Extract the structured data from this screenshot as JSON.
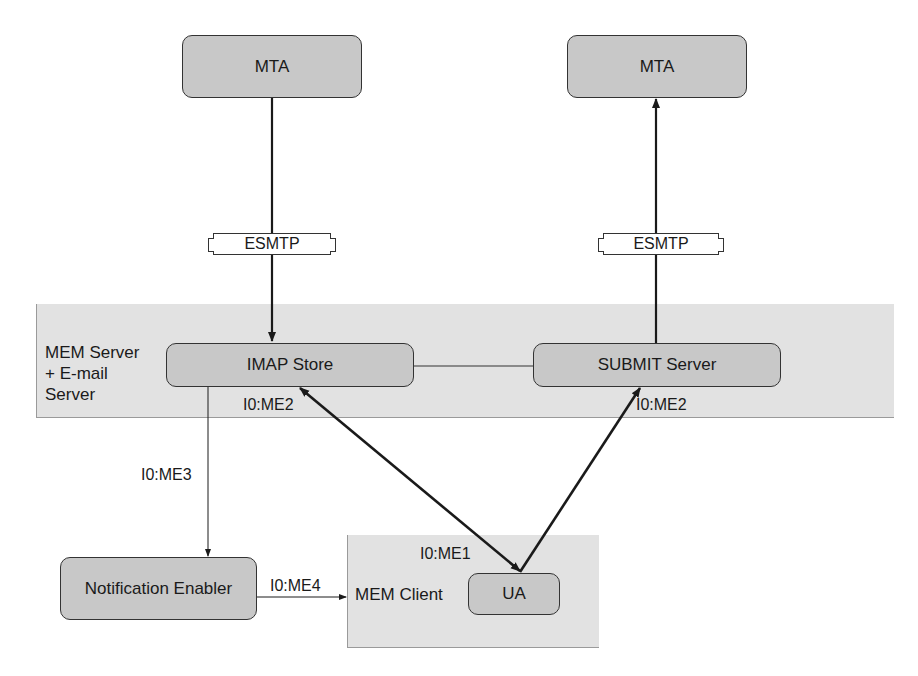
{
  "diagram": {
    "regions": {
      "server": {
        "label_lines": [
          "MEM Server",
          "+ E-mail",
          "Server"
        ]
      },
      "client": {
        "label": "MEM Client"
      }
    },
    "nodes": {
      "mta_left": "MTA",
      "mta_right": "MTA",
      "imap_store": "IMAP Store",
      "submit_server": "SUBMIT Server",
      "notification_enabler": "Notification Enabler",
      "ua": "UA"
    },
    "protocols": {
      "esmtp_left": "ESMTP",
      "esmtp_right": "ESMTP"
    },
    "interfaces": {
      "imap_me2": "I0:ME2",
      "submit_me2": "I0:ME2",
      "me3": "I0:ME3",
      "me4": "I0:ME4",
      "me1": "I0:ME1"
    },
    "edges": [
      {
        "from": "MTA (left)",
        "to": "IMAP Store",
        "via": "ESMTP",
        "direction": "to"
      },
      {
        "from": "SUBMIT Server",
        "to": "MTA (right)",
        "via": "ESMTP",
        "direction": "to"
      },
      {
        "from": "IMAP Store",
        "to": "SUBMIT Server",
        "direction": "none"
      },
      {
        "from": "IMAP Store",
        "to": "Notification Enabler",
        "label": "I0:ME3",
        "direction": "to"
      },
      {
        "from": "Notification Enabler",
        "to": "MEM Client",
        "label": "I0:ME4",
        "direction": "to"
      },
      {
        "from": "UA",
        "to": "IMAP Store",
        "label": "I0:ME2 / I0:ME1",
        "direction": "both"
      },
      {
        "from": "UA",
        "to": "SUBMIT Server",
        "label": "I0:ME2",
        "direction": "to"
      }
    ],
    "colors": {
      "region_fill": "#e2e2e2",
      "node_fill": "#c8c8c8",
      "stroke": "#1a1a1a"
    }
  }
}
